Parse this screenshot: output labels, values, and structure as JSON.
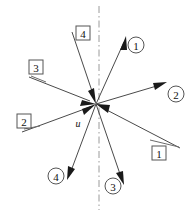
{
  "figure": {
    "background_color": "#ffffff",
    "line_color": "#4a4a4a",
    "arrow_color": "#1a1a1a",
    "axis_color": "#9a9a9a",
    "label_box_stroke": "#555555",
    "origin": {
      "x": 96,
      "y": 104,
      "label": "u"
    },
    "centerline": {
      "name": "vertical-dash-dot-axis",
      "x": 99,
      "y_top": 6,
      "y_bottom": 210,
      "style": "dash-dot"
    },
    "incoming_rays": [
      {
        "id": "box-1",
        "label": "1",
        "label_kind": "box",
        "direction": "inward",
        "from": {
          "x": 180,
          "y": 148
        },
        "to": {
          "x": 96,
          "y": 104
        },
        "label_pos": {
          "x": 159,
          "y": 153
        },
        "leader": {
          "x1": 151,
          "y1": 141,
          "x2": 178,
          "y2": 147
        }
      },
      {
        "id": "box-2",
        "label": "2",
        "label_kind": "box",
        "direction": "inward",
        "from": {
          "x": 22,
          "y": 132
        },
        "to": {
          "x": 96,
          "y": 104
        },
        "label_pos": {
          "x": 24,
          "y": 121
        },
        "leader": {
          "x1": 24,
          "y1": 129,
          "x2": 38,
          "y2": 127
        }
      },
      {
        "id": "box-3",
        "label": "3",
        "label_kind": "box",
        "direction": "inward",
        "from": {
          "x": 29,
          "y": 77
        },
        "to": {
          "x": 96,
          "y": 104
        },
        "label_pos": {
          "x": 36,
          "y": 67
        },
        "leader": {
          "x1": 31,
          "y1": 74,
          "x2": 44,
          "y2": 81
        }
      },
      {
        "id": "box-4",
        "label": "4",
        "label_kind": "box",
        "direction": "inward",
        "from": {
          "x": 72,
          "y": 32
        },
        "to": {
          "x": 96,
          "y": 104
        },
        "label_pos": {
          "x": 83,
          "y": 33
        },
        "leader": null
      }
    ],
    "outgoing_rays": [
      {
        "id": "circle-1",
        "label": "1",
        "label_kind": "circle",
        "direction": "outward",
        "from": {
          "x": 96,
          "y": 104
        },
        "to": {
          "x": 124,
          "y": 38
        },
        "label_pos": {
          "x": 136,
          "y": 45
        }
      },
      {
        "id": "circle-2",
        "label": "2",
        "label_kind": "circle",
        "direction": "outward",
        "from": {
          "x": 96,
          "y": 104
        },
        "to": {
          "x": 165,
          "y": 83
        },
        "label_pos": {
          "x": 176,
          "y": 94
        }
      },
      {
        "id": "circle-3",
        "label": "3",
        "label_kind": "circle",
        "direction": "outward",
        "from": {
          "x": 96,
          "y": 104
        },
        "to": {
          "x": 124,
          "y": 184
        },
        "label_pos": {
          "x": 113,
          "y": 186
        }
      },
      {
        "id": "circle-4",
        "label": "4",
        "label_kind": "circle",
        "direction": "outward",
        "from": {
          "x": 96,
          "y": 104
        },
        "to": {
          "x": 68,
          "y": 178
        },
        "label_pos": {
          "x": 56,
          "y": 176
        }
      }
    ]
  }
}
